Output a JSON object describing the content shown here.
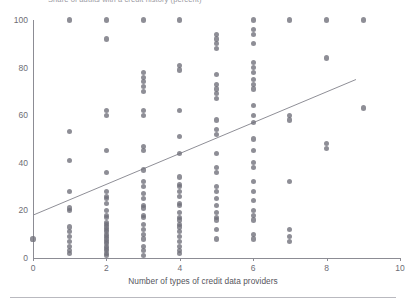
{
  "figure": {
    "clipped_title": "Share of adults with a credit history (percent)",
    "background_color": "#ffffff"
  },
  "axes": {
    "x_title": "Number of types of credit data providers",
    "x_ticks": [
      0,
      2,
      4,
      6,
      8,
      10
    ],
    "y_ticks": [
      0,
      20,
      40,
      60,
      80,
      100
    ],
    "axis_color": "#8c8c94",
    "tick_label_color": "#6d6d75"
  },
  "marker": {
    "color": "#6e6e78",
    "opacity": 0.78
  },
  "trendline": {
    "color": "#8f8f97",
    "width": 1
  },
  "chart_data": {
    "type": "scatter",
    "title": "Share of adults with a credit history (percent)",
    "xlabel": "Number of types of credit data providers",
    "ylabel": "",
    "xlim": [
      0,
      10
    ],
    "ylim": [
      0,
      100
    ],
    "xticks": [
      0,
      2,
      4,
      6,
      8,
      10
    ],
    "yticks": [
      0,
      20,
      40,
      60,
      80,
      100
    ],
    "grid": false,
    "legend": "none",
    "series": [
      {
        "name": "Economies",
        "points": [
          [
            0,
            8
          ],
          [
            1,
            100
          ],
          [
            1,
            53
          ],
          [
            1,
            41
          ],
          [
            1,
            28
          ],
          [
            1,
            21
          ],
          [
            1,
            20
          ],
          [
            1,
            13
          ],
          [
            1,
            11
          ],
          [
            1,
            9
          ],
          [
            1,
            7
          ],
          [
            1,
            5
          ],
          [
            1,
            3
          ],
          [
            1,
            2
          ],
          [
            2,
            100
          ],
          [
            2,
            92
          ],
          [
            2,
            62
          ],
          [
            2,
            60
          ],
          [
            2,
            45
          ],
          [
            2,
            36
          ],
          [
            2,
            28
          ],
          [
            2,
            26
          ],
          [
            2,
            25
          ],
          [
            2,
            23
          ],
          [
            2,
            20
          ],
          [
            2,
            18
          ],
          [
            2,
            17
          ],
          [
            2,
            15
          ],
          [
            2,
            14
          ],
          [
            2,
            13
          ],
          [
            2,
            12
          ],
          [
            2,
            11
          ],
          [
            2,
            10
          ],
          [
            2,
            9
          ],
          [
            2,
            8
          ],
          [
            2,
            7
          ],
          [
            2,
            6
          ],
          [
            2,
            5
          ],
          [
            2,
            4
          ],
          [
            2,
            3
          ],
          [
            2,
            2
          ],
          [
            2,
            1
          ],
          [
            3,
            100
          ],
          [
            3,
            78
          ],
          [
            3,
            76
          ],
          [
            3,
            74
          ],
          [
            3,
            72
          ],
          [
            3,
            70
          ],
          [
            3,
            62
          ],
          [
            3,
            60
          ],
          [
            3,
            47
          ],
          [
            3,
            45
          ],
          [
            3,
            37
          ],
          [
            3,
            32
          ],
          [
            3,
            30
          ],
          [
            3,
            27
          ],
          [
            3,
            25
          ],
          [
            3,
            22
          ],
          [
            3,
            21
          ],
          [
            3,
            18
          ],
          [
            3,
            17
          ],
          [
            3,
            14
          ],
          [
            3,
            12
          ],
          [
            3,
            10
          ],
          [
            3,
            8
          ],
          [
            3,
            5
          ],
          [
            3,
            3
          ],
          [
            3,
            1
          ],
          [
            4,
            100
          ],
          [
            4,
            81
          ],
          [
            4,
            79
          ],
          [
            4,
            62
          ],
          [
            4,
            51
          ],
          [
            4,
            44
          ],
          [
            4,
            34
          ],
          [
            4,
            31
          ],
          [
            4,
            30
          ],
          [
            4,
            28
          ],
          [
            4,
            26
          ],
          [
            4,
            23
          ],
          [
            4,
            22
          ],
          [
            4,
            19
          ],
          [
            4,
            17
          ],
          [
            4,
            16
          ],
          [
            4,
            14
          ],
          [
            4,
            13
          ],
          [
            4,
            11
          ],
          [
            4,
            9
          ],
          [
            4,
            7
          ],
          [
            4,
            5
          ],
          [
            4,
            3
          ],
          [
            4,
            2
          ],
          [
            5,
            94
          ],
          [
            5,
            92
          ],
          [
            5,
            90
          ],
          [
            5,
            88
          ],
          [
            5,
            77
          ],
          [
            5,
            73
          ],
          [
            5,
            71
          ],
          [
            5,
            69
          ],
          [
            5,
            67
          ],
          [
            5,
            58
          ],
          [
            5,
            54
          ],
          [
            5,
            52
          ],
          [
            5,
            44
          ],
          [
            5,
            38
          ],
          [
            5,
            36
          ],
          [
            5,
            30
          ],
          [
            5,
            28
          ],
          [
            5,
            25
          ],
          [
            5,
            22
          ],
          [
            5,
            19
          ],
          [
            5,
            17
          ],
          [
            5,
            16
          ],
          [
            5,
            12
          ],
          [
            5,
            8
          ],
          [
            6,
            100
          ],
          [
            6,
            96
          ],
          [
            6,
            94
          ],
          [
            6,
            90
          ],
          [
            6,
            82
          ],
          [
            6,
            80
          ],
          [
            6,
            78
          ],
          [
            6,
            75
          ],
          [
            6,
            73
          ],
          [
            6,
            71
          ],
          [
            6,
            64
          ],
          [
            6,
            60
          ],
          [
            6,
            57
          ],
          [
            6,
            50
          ],
          [
            6,
            45
          ],
          [
            6,
            40
          ],
          [
            6,
            38
          ],
          [
            6,
            32
          ],
          [
            6,
            28
          ],
          [
            6,
            24
          ],
          [
            6,
            20
          ],
          [
            6,
            18
          ],
          [
            6,
            16
          ],
          [
            6,
            10
          ],
          [
            6,
            8
          ],
          [
            7,
            100
          ],
          [
            7,
            60
          ],
          [
            7,
            58
          ],
          [
            7,
            32
          ],
          [
            7,
            12
          ],
          [
            7,
            9
          ],
          [
            7,
            7
          ],
          [
            8,
            100
          ],
          [
            8,
            84
          ],
          [
            8,
            48
          ],
          [
            8,
            46
          ],
          [
            9,
            100
          ],
          [
            9,
            63
          ]
        ]
      }
    ],
    "trendline": {
      "x": [
        0,
        8.8
      ],
      "y": [
        18,
        75
      ],
      "description": "upward-sloping linear fit"
    }
  }
}
